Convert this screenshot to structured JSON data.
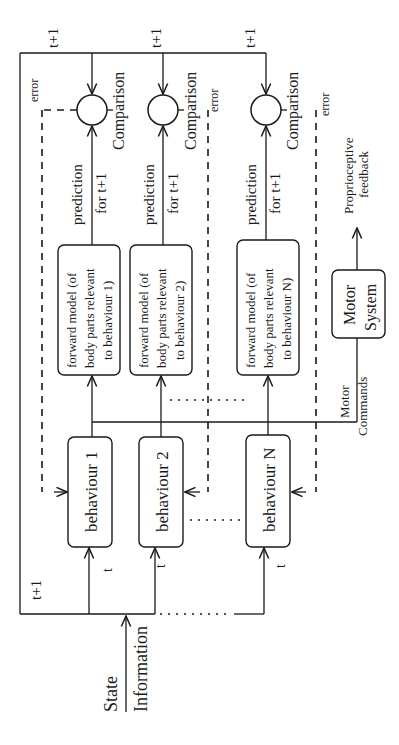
{
  "diagram": {
    "orientation": "rotated 90 degrees counter-clockwise",
    "input": {
      "line1": "State",
      "line2": "Information"
    },
    "time_labels": {
      "t": "t",
      "t_plus_1": "t+1"
    },
    "behaviours": [
      {
        "label": "behaviour 1"
      },
      {
        "label": "behaviour 2"
      },
      {
        "label": "behaviour N"
      }
    ],
    "forward_models": [
      {
        "line1": "forward model  (of",
        "line2": "body parts relevant",
        "line3": "to behaviour 1)"
      },
      {
        "line1": "forward model  (of",
        "line2": "body parts relevant",
        "line3": "to behaviour 2)"
      },
      {
        "line1": "forward model  (of",
        "line2": "body parts relevant",
        "line3": "to behaviour N)"
      }
    ],
    "predictions": [
      {
        "line1": "prediction",
        "line2": "for t+1"
      },
      {
        "line1": "prediction",
        "line2": "for t+1"
      },
      {
        "line1": "prediction",
        "line2": "for t+1"
      }
    ],
    "comparisons": [
      {
        "label": "Comparison",
        "error": "error"
      },
      {
        "label": "Comparison",
        "error": "error"
      },
      {
        "label": "Comparison",
        "error": "error"
      }
    ],
    "motor_commands": {
      "line1": "Motor",
      "line2": "Commands"
    },
    "motor_system": {
      "line1": "Motor",
      "line2": "System"
    },
    "feedback": {
      "line1": "Proprioceptive",
      "line2": "feedback"
    }
  }
}
